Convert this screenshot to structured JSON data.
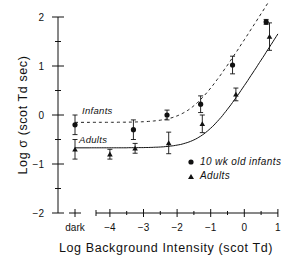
{
  "chart_data": {
    "type": "scatter",
    "title": "",
    "xlabel": "Log Background Intensity (scot Td)",
    "ylabel": "Log σ (scot Td sec)",
    "xlim": [
      -4.6,
      1
    ],
    "ylim": [
      -2,
      2
    ],
    "grid": false,
    "x_ticks": [
      "dark",
      "-4",
      "-3",
      "-2",
      "-1",
      "0",
      "1"
    ],
    "y_ticks": [
      "-2",
      "-1",
      "0",
      "1",
      "2"
    ],
    "legend_position": "lower right",
    "legend": [
      "10 wk old infants",
      "Adults"
    ],
    "annotations": [
      "Infants",
      "Adults"
    ],
    "series": [
      {
        "name": "10 wk old infants",
        "marker": "circle",
        "fit_line": "dashed",
        "x": [
          "dark",
          -3.3,
          -2.3,
          -1.3,
          -0.35,
          0.65
        ],
        "y": [
          -0.2,
          -0.3,
          0.0,
          0.22,
          1.02,
          1.9
        ],
        "err": [
          0.2,
          0.2,
          0.1,
          0.17,
          0.18,
          0.05
        ]
      },
      {
        "name": "Adults",
        "marker": "triangle",
        "fit_line": "solid",
        "x": [
          "dark",
          -4.0,
          -3.25,
          -2.25,
          -1.25,
          -0.25,
          0.75
        ],
        "y": [
          -0.7,
          -0.8,
          -0.68,
          -0.57,
          -0.18,
          0.42,
          1.6
        ],
        "err": [
          0.2,
          0.1,
          0.1,
          0.22,
          0.18,
          0.13,
          0.28
        ]
      }
    ],
    "fits": {
      "infants": {
        "plateau": -0.15,
        "style": "dashed"
      },
      "adults": {
        "plateau": -0.67,
        "style": "solid"
      }
    }
  }
}
